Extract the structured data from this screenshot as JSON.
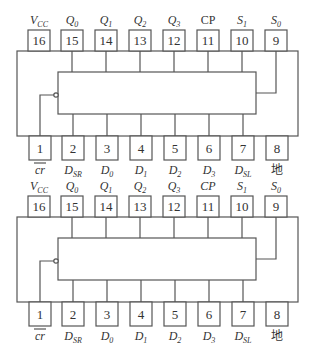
{
  "diagrams": [
    {
      "name": "74LS194 pinout diagram A",
      "top_pins": [
        {
          "num": "16",
          "label": "V",
          "sub": "CC",
          "italic": true
        },
        {
          "num": "15",
          "label": "Q",
          "sub": "0",
          "italic": true
        },
        {
          "num": "14",
          "label": "Q",
          "sub": "1",
          "italic": true
        },
        {
          "num": "13",
          "label": "Q",
          "sub": "2",
          "italic": true
        },
        {
          "num": "12",
          "label": "Q",
          "sub": "3",
          "italic": true
        },
        {
          "num": "11",
          "label": "CP",
          "sub": "",
          "italic": false
        },
        {
          "num": "10",
          "label": "S",
          "sub": "1",
          "italic": true
        },
        {
          "num": "9",
          "label": "S",
          "sub": "0",
          "italic": true
        }
      ],
      "bottom_pins": [
        {
          "num": "1",
          "label": "cr",
          "sub": "",
          "italic": true,
          "overline": true
        },
        {
          "num": "2",
          "label": "D",
          "sub": "SR",
          "italic": true
        },
        {
          "num": "3",
          "label": "D",
          "sub": "0",
          "italic": true
        },
        {
          "num": "4",
          "label": "D",
          "sub": "1",
          "italic": true
        },
        {
          "num": "5",
          "label": "D",
          "sub": "2",
          "italic": true
        },
        {
          "num": "6",
          "label": "D",
          "sub": "3",
          "italic": true
        },
        {
          "num": "7",
          "label": "D",
          "sub": "SL",
          "italic": true
        },
        {
          "num": "8",
          "label": "地",
          "sub": "",
          "italic": false
        }
      ]
    },
    {
      "name": "74LS194 pinout diagram B",
      "top_pins": [
        {
          "num": "16",
          "label": "V",
          "sub": "CC",
          "italic": true
        },
        {
          "num": "15",
          "label": "Q",
          "sub": "0",
          "italic": true
        },
        {
          "num": "14",
          "label": "Q",
          "sub": "1",
          "italic": true
        },
        {
          "num": "13",
          "label": "Q",
          "sub": "2",
          "italic": true
        },
        {
          "num": "12",
          "label": "Q",
          "sub": "3",
          "italic": true
        },
        {
          "num": "11",
          "label": "CP",
          "sub": "",
          "italic": true
        },
        {
          "num": "10",
          "label": "S",
          "sub": "1",
          "italic": true
        },
        {
          "num": "9",
          "label": "S",
          "sub": "0",
          "italic": true
        }
      ],
      "bottom_pins": [
        {
          "num": "1",
          "label": "cr",
          "sub": "",
          "italic": true,
          "overline": true
        },
        {
          "num": "2",
          "label": "D",
          "sub": "SR",
          "italic": true
        },
        {
          "num": "3",
          "label": "D",
          "sub": "0",
          "italic": true
        },
        {
          "num": "4",
          "label": "D",
          "sub": "1",
          "italic": true
        },
        {
          "num": "5",
          "label": "D",
          "sub": "2",
          "italic": true
        },
        {
          "num": "6",
          "label": "D",
          "sub": "3",
          "italic": true
        },
        {
          "num": "7",
          "label": "D",
          "sub": "SL",
          "italic": true
        },
        {
          "num": "8",
          "label": "地",
          "sub": "",
          "italic": false
        }
      ]
    }
  ]
}
